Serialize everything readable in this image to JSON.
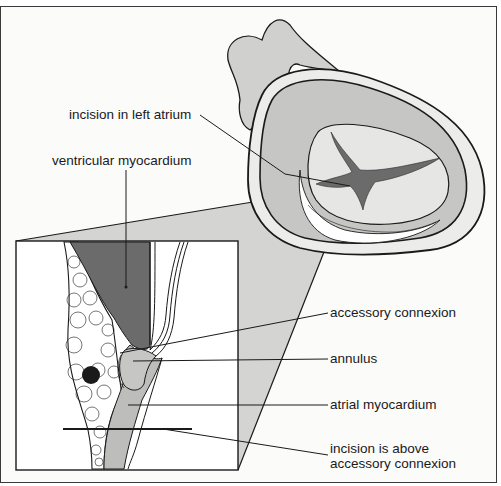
{
  "diagram": {
    "type": "anatomical-illustration",
    "labels": {
      "incision_left_atrium": "incision in left atrium",
      "ventricular_myocardium": "ventricular myocardium",
      "accessory_connexion": "accessory connexion",
      "annulus": "annulus",
      "atrial_myocardium": "atrial myocardium",
      "incision_above_line1": "incision is above",
      "incision_above_line2": "accessory connexion"
    },
    "colors": {
      "background": "#fbfbfa",
      "light_gray": "#d9d9d7",
      "mid_gray": "#bdbdbb",
      "dark_gray": "#6b6b6b",
      "outline": "#1a1a1a",
      "inset_background": "#ffffff"
    }
  }
}
